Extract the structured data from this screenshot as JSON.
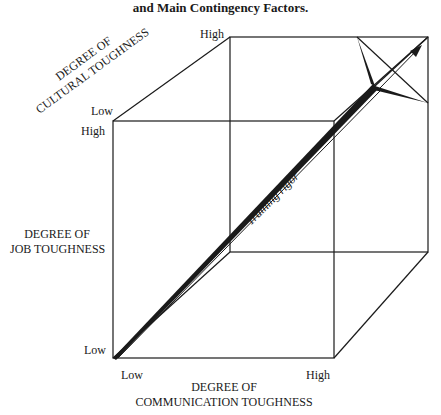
{
  "figure": {
    "caption_line_1_partial": "Figure: Degree of Rigor of Cross-Cultural Training Program",
    "caption_line_2": "and Main Contingency Factors."
  },
  "axes": {
    "communication": {
      "title_line_1": "DEGREE OF",
      "title_line_2": "COMMUNICATION TOUGHNESS",
      "low": "Low",
      "high": "High"
    },
    "job": {
      "title_line_1": "DEGREE OF",
      "title_line_2": "JOB TOUGHNESS",
      "low": "Low",
      "high": "High"
    },
    "cultural": {
      "title_line_1": "DEGREE OF",
      "title_line_2": "CULTURAL TOUGHNESS",
      "low": "Low",
      "high": "High"
    }
  },
  "vector": {
    "label": "Training rigor"
  },
  "colors": {
    "line": "#1a1a1a",
    "background": "#ffffff"
  }
}
